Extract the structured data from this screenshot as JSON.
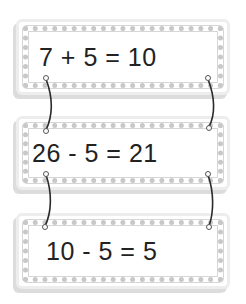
{
  "cards": [
    {
      "equation": "7 + 5 = 10"
    },
    {
      "equation": "26 - 5 = 21"
    },
    {
      "equation": "10 - 5 = 5"
    }
  ],
  "colors": {
    "text": "#222222",
    "border": "#c8c8c8",
    "string": "#2a2a2a"
  }
}
